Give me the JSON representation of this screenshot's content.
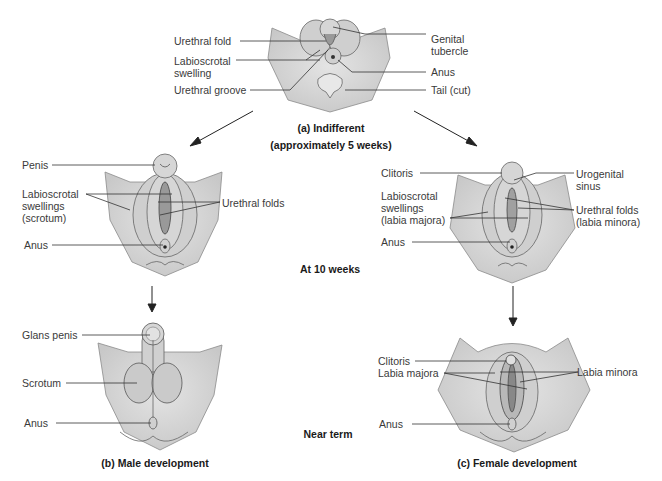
{
  "panels": {
    "indifferent": {
      "caption": "(a) Indifferent",
      "subcaption": "(approximately 5 weeks)",
      "labels": {
        "urethral_fold": "Urethral fold",
        "labioscrotal_swelling": "Labioscrotal\nswelling",
        "urethral_groove": "Urethral groove",
        "genital_tubercle": "Genital\ntubercle",
        "anus": "Anus",
        "tail": "Tail (cut)"
      }
    },
    "male_10wk": {
      "labels": {
        "penis": "Penis",
        "labioscrotal_swellings": "Labioscrotal\nswellings\n(scrotum)",
        "urethral_folds": "Urethral folds",
        "anus": "Anus"
      }
    },
    "female_10wk": {
      "labels": {
        "clitoris": "Clitoris",
        "labioscrotal_swellings": "Labioscrotal\nswellings\n(labia majora)",
        "urogenital_sinus": "Urogenital\nsinus",
        "urethral_folds": "Urethral folds\n(labia minora)",
        "anus": "Anus"
      }
    },
    "male_term": {
      "caption": "(b) Male development",
      "labels": {
        "glans_penis": "Glans penis",
        "scrotum": "Scrotum",
        "anus": "Anus"
      }
    },
    "female_term": {
      "caption": "(c) Female development",
      "labels": {
        "clitoris": "Clitoris",
        "labia_majora": "Labia majora",
        "labia_minora": "Labia minora",
        "anus": "Anus"
      }
    }
  },
  "stage_labels": {
    "at_10_weeks": "At 10 weeks",
    "near_term": "Near term"
  },
  "colors": {
    "tissue": "#d9d9d9",
    "tissue_dark": "#bdbdbd",
    "outline": "#6b6b6b",
    "leader": "#333333"
  }
}
